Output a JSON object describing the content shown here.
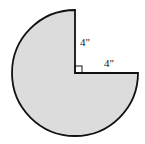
{
  "figure": {
    "shape": "three-quarter circle sector",
    "fill_color": "#dcdcdc",
    "stroke_color": "#111111",
    "radius_label_vertical": "4\"",
    "radius_label_horizontal": "4\"",
    "right_angle_marker": true
  }
}
